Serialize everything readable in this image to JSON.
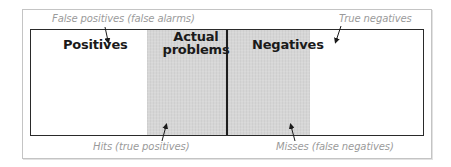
{
  "diagram": {
    "regions": {
      "positives_label": "Positives",
      "negatives_label": "Negatives",
      "actual_problems_label": "Actual problems"
    },
    "callouts": {
      "false_positives": "False positives (false alarms)",
      "true_negatives": "True negatives",
      "hits": "Hits (true positives)",
      "misses": "Misses (false negatives)"
    },
    "colors": {
      "actual_problems_fill": "#d6d6d6",
      "border": "#2a2a2a",
      "callout_text": "#9a9a9a",
      "outer_frame": "#c4c4c4"
    }
  }
}
